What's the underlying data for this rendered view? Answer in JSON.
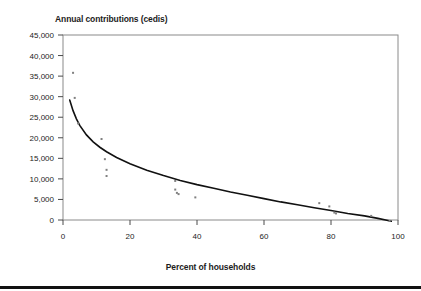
{
  "figure": {
    "title": "Annual contributions (cedis)",
    "xlabel": "Percent of households",
    "background_color": "#ffffff",
    "rule_color": "#121212"
  },
  "chart_data": {
    "type": "scatter",
    "title": "Annual contributions (cedis)",
    "subtitle": "",
    "xlabel": "Percent of households",
    "ylabel": "Annual contributions (cedis)",
    "xlim": [
      0,
      100
    ],
    "ylim": [
      0,
      45000
    ],
    "grid": false,
    "legend": null,
    "legend_position": "none",
    "xticks": [
      0,
      20,
      40,
      60,
      80,
      100
    ],
    "xtick_labels": [
      "0",
      "20",
      "40",
      "60",
      "80",
      "100"
    ],
    "yticks": [
      0,
      5000,
      10000,
      15000,
      20000,
      25000,
      30000,
      35000,
      40000,
      45000
    ],
    "ytick_labels": [
      "0",
      "5,000",
      "10,000",
      "15,000",
      "20,000",
      "25,000",
      "30,000",
      "35,000",
      "40,000",
      "45,000"
    ],
    "marker_color": "#808080",
    "marker_shape": "square",
    "marker_size_px": 2,
    "series": [
      {
        "name": "Observed contributions",
        "type": "scatter",
        "points": [
          {
            "x": 3.0,
            "y": 35800
          },
          {
            "x": 3.5,
            "y": 29700
          },
          {
            "x": 4.5,
            "y": 23500
          },
          {
            "x": 11.5,
            "y": 19700
          },
          {
            "x": 12.5,
            "y": 14800
          },
          {
            "x": 13.0,
            "y": 12200
          },
          {
            "x": 13.0,
            "y": 10700
          },
          {
            "x": 33.5,
            "y": 9500
          },
          {
            "x": 33.5,
            "y": 7400
          },
          {
            "x": 34.0,
            "y": 6600
          },
          {
            "x": 34.5,
            "y": 6300
          },
          {
            "x": 39.5,
            "y": 5500
          },
          {
            "x": 76.5,
            "y": 4100
          },
          {
            "x": 79.5,
            "y": 3300
          },
          {
            "x": 81.0,
            "y": 1800
          },
          {
            "x": 81.5,
            "y": 1600
          },
          {
            "x": 92.0,
            "y": 1000
          },
          {
            "x": 97.5,
            "y": -200
          }
        ]
      },
      {
        "name": "Fitted curve",
        "type": "line",
        "line_color": "#111111",
        "line_width_px": 1.6,
        "points": [
          {
            "x": 2.0,
            "y": 29200
          },
          {
            "x": 3.0,
            "y": 26600
          },
          {
            "x": 4.0,
            "y": 24600
          },
          {
            "x": 5.0,
            "y": 23000
          },
          {
            "x": 7.0,
            "y": 20700
          },
          {
            "x": 9.0,
            "y": 19000
          },
          {
            "x": 11.0,
            "y": 17700
          },
          {
            "x": 13.0,
            "y": 16600
          },
          {
            "x": 16.0,
            "y": 15200
          },
          {
            "x": 20.0,
            "y": 13700
          },
          {
            "x": 25.0,
            "y": 12100
          },
          {
            "x": 30.0,
            "y": 10800
          },
          {
            "x": 35.0,
            "y": 9600
          },
          {
            "x": 40.0,
            "y": 8600
          },
          {
            "x": 45.0,
            "y": 7700
          },
          {
            "x": 50.0,
            "y": 6800
          },
          {
            "x": 55.0,
            "y": 6000
          },
          {
            "x": 60.0,
            "y": 5200
          },
          {
            "x": 65.0,
            "y": 4400
          },
          {
            "x": 70.0,
            "y": 3700
          },
          {
            "x": 75.0,
            "y": 3000
          },
          {
            "x": 80.0,
            "y": 2300
          },
          {
            "x": 85.0,
            "y": 1600
          },
          {
            "x": 90.0,
            "y": 1000
          },
          {
            "x": 94.0,
            "y": 400
          },
          {
            "x": 97.0,
            "y": -100
          },
          {
            "x": 98.0,
            "y": -300
          }
        ]
      }
    ]
  }
}
